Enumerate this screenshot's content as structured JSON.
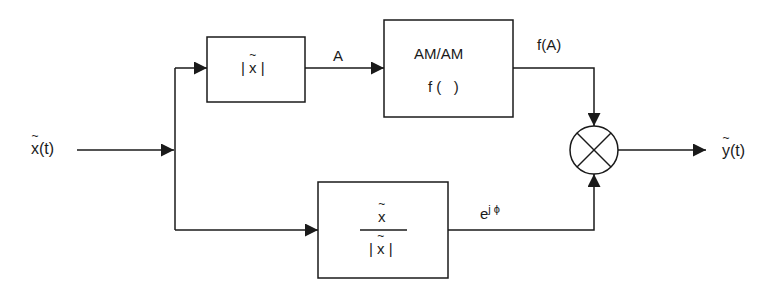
{
  "diagram": {
    "title": "",
    "input": {
      "symbol": "x",
      "arg": "(t)",
      "has_tilde": true
    },
    "output": {
      "symbol": "y",
      "arg": "(t)",
      "has_tilde": true
    },
    "blocks": [
      {
        "id": "magnitude",
        "label": "|x̃|",
        "bar_left": "|",
        "symbol": "x",
        "bar_right": "|"
      },
      {
        "id": "amam",
        "line1": "AM/AM",
        "line2": "f (   )"
      },
      {
        "id": "normalize",
        "numerator": "x",
        "denominator_symbol": "x",
        "bar": "|"
      }
    ],
    "signals": {
      "amplitude": "A",
      "am_output": "f(A)",
      "phase_base": "e",
      "phase_exp": "j ϕ"
    },
    "operators": [
      {
        "id": "multiplier",
        "type": "multiply",
        "glyph": "⊗"
      }
    ],
    "colors": {
      "line": "#1a1a1a",
      "background": "#ffffff"
    }
  }
}
